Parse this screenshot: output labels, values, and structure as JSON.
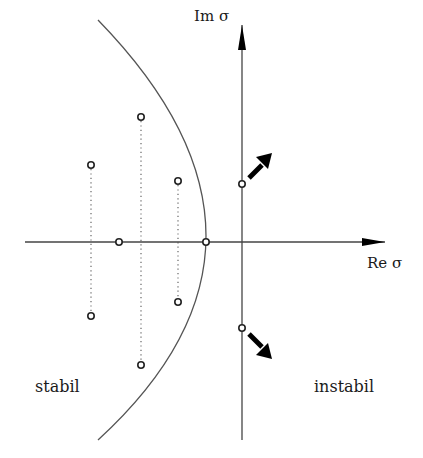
{
  "diagram": {
    "axes": {
      "imag_label": "Im σ",
      "real_label": "Re σ",
      "origin": [
        242,
        242
      ],
      "real_axis": {
        "x_start": 25,
        "x_end": 385
      },
      "imag_axis": {
        "y_start": 440,
        "y_end": 25
      }
    },
    "regions": {
      "left_label": "stabil",
      "right_label": "instabil"
    },
    "curve": {
      "type": "parabola",
      "vertex": [
        278,
        242
      ],
      "crosses_imag_axis_at_y": [
        184,
        328
      ],
      "top_end": [
        98,
        20
      ],
      "bottom_end": [
        98,
        440
      ]
    },
    "poles": [
      {
        "x": 91,
        "y": 165,
        "pair": "a"
      },
      {
        "x": 91,
        "y": 316,
        "pair": "a"
      },
      {
        "x": 141,
        "y": 117,
        "pair": "b"
      },
      {
        "x": 141,
        "y": 365,
        "pair": "b"
      },
      {
        "x": 178,
        "y": 181,
        "pair": "c"
      },
      {
        "x": 178,
        "y": 302,
        "pair": "c"
      },
      {
        "x": 119,
        "y": 242,
        "pair": "real"
      },
      {
        "x": 206,
        "y": 242,
        "pair": "real"
      },
      {
        "x": 242,
        "y": 184,
        "pair": "critical"
      },
      {
        "x": 242,
        "y": 328,
        "pair": "critical"
      }
    ],
    "motion_arrows": [
      {
        "from": [
          249,
          178
        ],
        "to": [
          272,
          156
        ],
        "direction": "up-right"
      },
      {
        "from": [
          249,
          334
        ],
        "to": [
          272,
          357
        ],
        "direction": "down-right"
      }
    ],
    "colors": {
      "line": "#444444",
      "arrow": "#000000",
      "text": "#1a1a1a",
      "background": "#ffffff"
    }
  }
}
